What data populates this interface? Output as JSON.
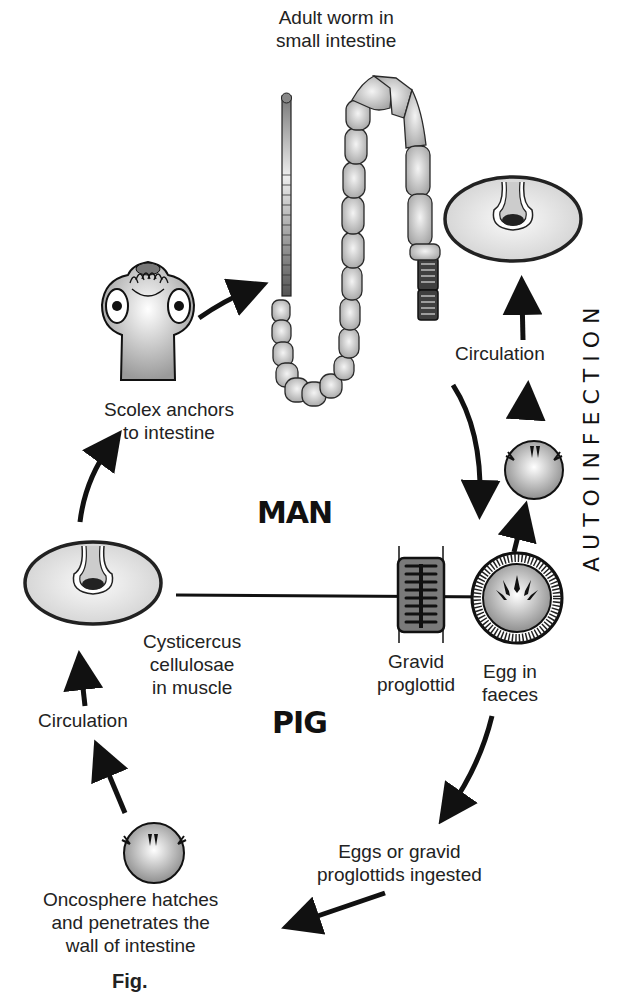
{
  "diagram": {
    "hosts": {
      "definitive": "MAN",
      "intermediate": "PIG"
    },
    "side_label": "AUTOINFECTION",
    "stages": {
      "adult_worm": {
        "line1": "Adult worm in",
        "line2": "small intestine"
      },
      "scolex": {
        "line1": "Scolex anchors",
        "line2": "to intestine"
      },
      "cysticercus": {
        "line1": "Cysticercus",
        "line2": "cellulosae",
        "line3": "in muscle"
      },
      "gravid_proglottid": {
        "line1": "Gravid",
        "line2": "proglottid"
      },
      "egg": {
        "line1": "Egg in",
        "line2": "faeces"
      },
      "ingested": {
        "line1": "Eggs or gravid",
        "line2": "proglottids ingested"
      },
      "oncosphere": {
        "line1": "Oncosphere hatches",
        "line2": "and penetrates the",
        "line3": "wall of intestine"
      },
      "circulation_pig": "Circulation",
      "circulation_autoinfection": "Circulation"
    },
    "caption": "Fig."
  },
  "colors": {
    "ink": "#111111",
    "segment_fill": "#c9c9c9",
    "gravid_fill": "#5a5a5a",
    "cyst_fill": "#e2e2e2"
  }
}
